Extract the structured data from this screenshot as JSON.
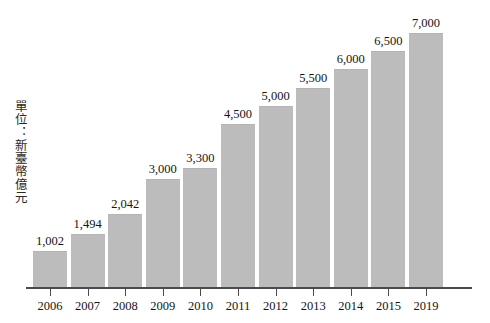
{
  "chart_data": {
    "type": "bar",
    "title": "",
    "subtitle": "",
    "xlabel": "",
    "ylabel": "單位：新臺幣億元",
    "categories": [
      "2006",
      "2007",
      "2008",
      "2009",
      "2010",
      "2011",
      "2012",
      "2013",
      "2014",
      "2015",
      "2019"
    ],
    "values": [
      1002,
      1494,
      2042,
      3000,
      3300,
      4500,
      5000,
      5500,
      6000,
      6500,
      7000
    ],
    "value_labels": [
      "1,002",
      "1,494",
      "2,042",
      "3,000",
      "3,300",
      "4,500",
      "5,000",
      "5,500",
      "6,000",
      "6,500",
      "7,000"
    ],
    "ylim": [
      0,
      7000
    ],
    "grid": false,
    "legend": null,
    "bar_color": "#bcbcbc",
    "axis_color": "#4a4a4a",
    "text_color": "#141414",
    "background_color": "#ffffff"
  },
  "axis": {
    "unit_caption": "單位：新臺幣億元"
  }
}
